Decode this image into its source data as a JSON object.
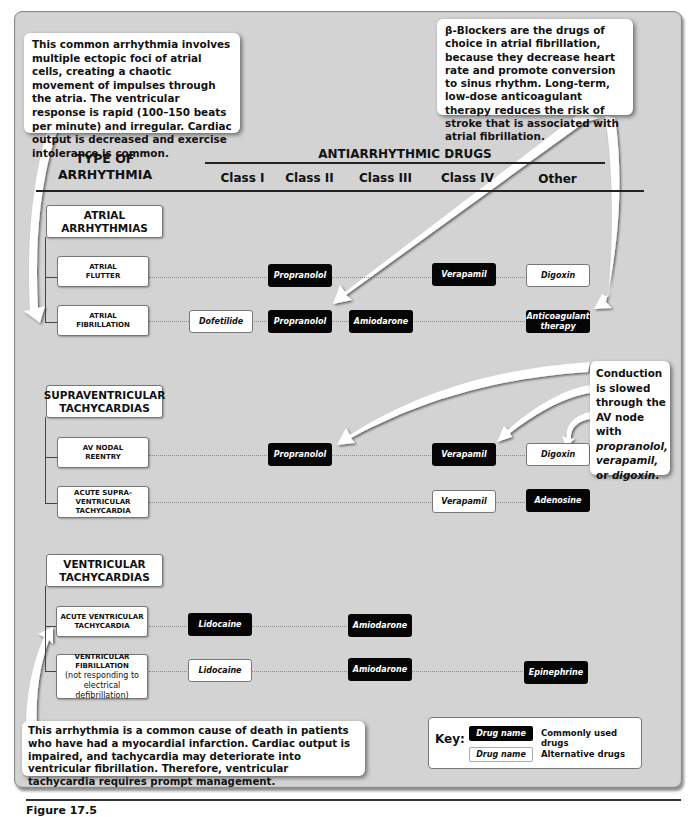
{
  "figure": {
    "caption": "Figure 17.5"
  },
  "callouts": {
    "atrial_fibrillation_note": "This common arrhythmia involves multiple ectopic foci of atrial cells, creating a chaotic movement of impulses through the atria. The ventricular response is rapid (100–150 beats per minute) and irregular.  Cardiac output is decreased and exercise intolerance is common.",
    "beta_blockers_note": "β-Blockers are the drugs of choice in atrial fibrillation, because they decrease heart rate and promote conversion to sinus rhythm. Long-term, low-dose anticoagulant therapy reduces the risk of stroke that is associated with atrial fibrillation.",
    "conduction_note_prefix": "Conduction is slowed through the AV node with ",
    "conduction_note_drug1": "propranolol,",
    "conduction_note_drug2": "verapamil,",
    "conduction_note_or": " or ",
    "conduction_note_drug3": "digoxin",
    "conduction_note_suffix": ".",
    "ventricular_tachycardia_note": "This arrhythmia is a common cause of death in patients who have had a myocardial infarction. Cardiac output is impaired, and tachycardia may deteriorate into ventricular fibrillation. Therefore, ventricular tachycardia requires prompt management."
  },
  "header": {
    "type_label_line1": "TYPE OF",
    "type_label_line2": "ARRHYTHMIA",
    "drugs_label": "ANTIARRHYTHMIC DRUGS",
    "columns": [
      "Class I",
      "Class II",
      "Class III",
      "Class IV",
      "Other"
    ]
  },
  "groups": [
    {
      "title_line1": "ATRIAL",
      "title_line2": "ARRHYTHMIAS",
      "rows": [
        {
          "name_lines": [
            "ATRIAL",
            "FLUTTER"
          ],
          "drugs": [
            {
              "col": "Class II",
              "name": "Propranolol",
              "type": "common"
            },
            {
              "col": "Class IV",
              "name": "Verapamil",
              "type": "common"
            },
            {
              "col": "Other",
              "name": "Digoxin",
              "type": "alternative"
            }
          ]
        },
        {
          "name_lines": [
            "ATRIAL",
            "FIBRILLATION"
          ],
          "drugs": [
            {
              "col": "Class I",
              "name": "Dofetilide",
              "type": "alternative"
            },
            {
              "col": "Class II",
              "name": "Propranolol",
              "type": "common"
            },
            {
              "col": "Class III",
              "name": "Amiodarone",
              "type": "common"
            },
            {
              "col": "Other",
              "name": "Anticoagulant therapy",
              "type": "common"
            }
          ]
        }
      ]
    },
    {
      "title_line1": "SUPRAVENTRICULAR",
      "title_line2": "TACHYCARDIAS",
      "rows": [
        {
          "name_lines": [
            "AV NODAL",
            "REENTRY"
          ],
          "drugs": [
            {
              "col": "Class II",
              "name": "Propranolol",
              "type": "common"
            },
            {
              "col": "Class IV",
              "name": "Verapamil",
              "type": "common"
            },
            {
              "col": "Other",
              "name": "Digoxin",
              "type": "alternative"
            }
          ]
        },
        {
          "name_lines": [
            "ACUTE SUPRA-",
            "VENTRICULAR",
            "TACHYCARDIA"
          ],
          "drugs": [
            {
              "col": "Class IV",
              "name": "Verapamil",
              "type": "alternative"
            },
            {
              "col": "Other",
              "name": "Adenosine",
              "type": "common"
            }
          ]
        }
      ]
    },
    {
      "title_line1": "VENTRICULAR",
      "title_line2": "TACHYCARDIAS",
      "rows": [
        {
          "name_lines": [
            "ACUTE VENTRICULAR",
            "TACHYCARDIA"
          ],
          "drugs": [
            {
              "col": "Class I",
              "name": "Lidocaine",
              "type": "common"
            },
            {
              "col": "Class III",
              "name": "Amiodarone",
              "type": "common"
            }
          ]
        },
        {
          "name_lines": [
            "VENTRICULAR",
            "FIBRILLATION",
            "(not responding to",
            "electrical defibrillation)"
          ],
          "drugs": [
            {
              "col": "Class I",
              "name": "Lidocaine",
              "type": "alternative"
            },
            {
              "col": "Class III",
              "name": "Amiodarone",
              "type": "common"
            },
            {
              "col": "Other",
              "name": "Epinephrine",
              "type": "common"
            }
          ]
        }
      ]
    }
  ],
  "key": {
    "label": "Key:",
    "sample_drug": "Drug name",
    "common_desc": "Commonly used drugs",
    "alternative_desc": "Alternative drugs"
  },
  "colors": {
    "panel_bg": "#d3d3d3",
    "common_drug_bg": "#050505",
    "alternative_drug_bg": "#ffffff"
  }
}
